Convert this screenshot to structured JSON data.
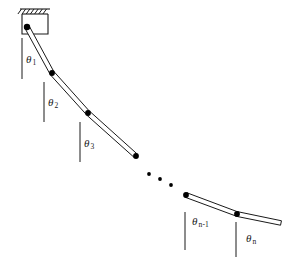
{
  "figure": {
    "background_color": "#ffffff",
    "stroke_color": "#1a1a1a",
    "rod_fill_color": "#ffffff",
    "joint_color": "#000000",
    "width": 288,
    "height": 263
  },
  "support": {
    "name": "ceiling-bracket",
    "hatch_count": 7,
    "box": {
      "x": 22,
      "y": 14,
      "width": 26,
      "height": 20
    },
    "hatch_bar": {
      "x": 20,
      "y": 9,
      "width": 30,
      "height": 5
    }
  },
  "pivot": {
    "x": 27,
    "y": 27,
    "radius": 3.2
  },
  "labels": {
    "theta": "θ",
    "angles": [
      {
        "name": "theta-1",
        "symbol": "θ",
        "subscript": "1",
        "x": 26,
        "y": 54
      },
      {
        "name": "theta-2",
        "symbol": "θ",
        "subscript": "2",
        "x": 48,
        "y": 97
      },
      {
        "name": "theta-3",
        "symbol": "θ",
        "subscript": "3",
        "x": 84,
        "y": 138
      },
      {
        "name": "theta-n-minus-1",
        "symbol": "θ",
        "subscript": "n-1",
        "x": 192,
        "y": 216
      },
      {
        "name": "theta-n",
        "symbol": "θ",
        "subscript": "n",
        "x": 246,
        "y": 233
      }
    ]
  },
  "reference_lines": [
    {
      "name": "vertical-reference-1",
      "x": 22,
      "y1": 38,
      "y2": 79
    },
    {
      "name": "vertical-reference-2",
      "x": 44,
      "y1": 82,
      "y2": 122
    },
    {
      "name": "vertical-reference-3",
      "x": 80,
      "y1": 122,
      "y2": 162
    },
    {
      "name": "vertical-reference-4",
      "x": 185,
      "y1": 212,
      "y2": 250
    },
    {
      "name": "vertical-reference-5",
      "x": 236,
      "y1": 222,
      "y2": 257
    }
  ],
  "rods": [
    {
      "name": "rod-1",
      "x1": 27,
      "y1": 27,
      "x2": 52,
      "y2": 73,
      "half_width": 2.4
    },
    {
      "name": "rod-2",
      "x1": 52,
      "y1": 73,
      "x2": 88,
      "y2": 113,
      "half_width": 2.4
    },
    {
      "name": "rod-3",
      "x1": 88,
      "y1": 113,
      "x2": 136,
      "y2": 156,
      "half_width": 2.4
    },
    {
      "name": "rod-n-minus-1",
      "x1": 186,
      "y1": 195,
      "x2": 237,
      "y2": 214,
      "half_width": 2.4
    },
    {
      "name": "rod-n",
      "x1": 237,
      "y1": 214,
      "x2": 281,
      "y2": 223,
      "half_width": 2.4
    }
  ],
  "joints": [
    {
      "name": "joint-1",
      "x": 52,
      "y": 73,
      "radius": 2.9
    },
    {
      "name": "joint-2",
      "x": 88,
      "y": 113,
      "radius": 2.9
    },
    {
      "name": "joint-3",
      "x": 136,
      "y": 156,
      "radius": 2.9
    },
    {
      "name": "joint-n-minus-1",
      "x": 186,
      "y": 195,
      "radius": 2.9
    },
    {
      "name": "joint-n",
      "x": 237,
      "y": 214,
      "radius": 2.9
    }
  ],
  "ellipsis": {
    "name": "continuation-dots",
    "dots": [
      {
        "x": 149,
        "y": 174,
        "radius": 1.9
      },
      {
        "x": 160,
        "y": 179,
        "radius": 1.9
      },
      {
        "x": 171,
        "y": 185,
        "radius": 1.9
      }
    ]
  }
}
